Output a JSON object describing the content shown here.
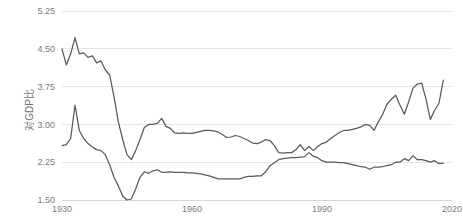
{
  "chart_data": {
    "type": "line",
    "title": "",
    "subtitle": "",
    "xlabel": "",
    "ylabel": "对GDP比",
    "xlim": [
      1930,
      2020
    ],
    "ylim": [
      1.5,
      5.25
    ],
    "grid": true,
    "legend_position": "none",
    "x_ticks": [
      "1930",
      "1960",
      "1990",
      "2020"
    ],
    "x_tick_values": [
      1930,
      1960,
      1990,
      2020
    ],
    "y_ticks": [
      "1.50",
      "2.25",
      "3.00",
      "3.75",
      "4.50",
      "5.25"
    ],
    "y_tick_values": [
      1.5,
      2.25,
      3.0,
      3.75,
      4.5,
      5.25
    ],
    "line_color": "#595959",
    "grid_color": "#dedede",
    "tick_label_color": "#7b7b7b",
    "background_color": "#ffffff",
    "x": [
      1930,
      1931,
      1932,
      1933,
      1934,
      1935,
      1936,
      1937,
      1938,
      1939,
      1940,
      1941,
      1942,
      1943,
      1944,
      1945,
      1946,
      1947,
      1948,
      1949,
      1950,
      1951,
      1952,
      1953,
      1954,
      1955,
      1956,
      1957,
      1958,
      1959,
      1960,
      1961,
      1962,
      1963,
      1964,
      1965,
      1966,
      1967,
      1968,
      1969,
      1970,
      1971,
      1972,
      1973,
      1974,
      1975,
      1976,
      1977,
      1978,
      1979,
      1980,
      1981,
      1982,
      1983,
      1984,
      1985,
      1986,
      1987,
      1988,
      1989,
      1990,
      1991,
      1992,
      1993,
      1994,
      1995,
      1996,
      1997,
      1998,
      1999,
      2000,
      2001,
      2002,
      2003,
      2004,
      2005,
      2006,
      2007,
      2008,
      2009,
      2010,
      2011,
      2012,
      2013,
      2014,
      2015,
      2016,
      2017,
      2018
    ],
    "series": [
      {
        "name": "series-upper",
        "values": [
          4.5,
          4.18,
          4.4,
          4.72,
          4.4,
          4.42,
          4.33,
          4.36,
          4.22,
          4.26,
          4.08,
          3.98,
          3.55,
          3.05,
          2.7,
          2.4,
          2.3,
          2.48,
          2.7,
          2.94,
          3.0,
          3.0,
          3.02,
          3.12,
          2.96,
          2.92,
          2.83,
          2.82,
          2.83,
          2.82,
          2.82,
          2.84,
          2.86,
          2.88,
          2.88,
          2.87,
          2.85,
          2.8,
          2.74,
          2.75,
          2.78,
          2.76,
          2.72,
          2.68,
          2.63,
          2.62,
          2.65,
          2.7,
          2.68,
          2.58,
          2.44,
          2.43,
          2.44,
          2.44,
          2.5,
          2.6,
          2.48,
          2.56,
          2.48,
          2.56,
          2.62,
          2.65,
          2.72,
          2.78,
          2.84,
          2.88,
          2.88,
          2.9,
          2.92,
          2.95,
          3.0,
          2.98,
          2.88,
          3.05,
          3.2,
          3.4,
          3.5,
          3.58,
          3.38,
          3.2,
          3.45,
          3.72,
          3.8,
          3.82,
          3.5,
          3.1,
          3.28,
          3.42,
          3.88
        ]
      },
      {
        "name": "series-lower",
        "values": [
          2.58,
          2.6,
          2.72,
          3.38,
          2.88,
          2.72,
          2.62,
          2.55,
          2.5,
          2.48,
          2.4,
          2.2,
          1.95,
          1.78,
          1.58,
          1.5,
          1.52,
          1.72,
          1.95,
          2.06,
          2.03,
          2.08,
          2.1,
          2.05,
          2.05,
          2.06,
          2.05,
          2.05,
          2.05,
          2.04,
          2.04,
          2.03,
          2.02,
          2.0,
          1.98,
          1.95,
          1.92,
          1.92,
          1.92,
          1.92,
          1.92,
          1.92,
          1.95,
          1.97,
          1.97,
          1.98,
          1.98,
          2.06,
          2.18,
          2.24,
          2.3,
          2.32,
          2.33,
          2.34,
          2.34,
          2.35,
          2.36,
          2.44,
          2.37,
          2.34,
          2.28,
          2.25,
          2.25,
          2.25,
          2.24,
          2.24,
          2.22,
          2.2,
          2.18,
          2.16,
          2.15,
          2.11,
          2.15,
          2.15,
          2.16,
          2.18,
          2.2,
          2.25,
          2.25,
          2.32,
          2.28,
          2.38,
          2.3,
          2.3,
          2.28,
          2.25,
          2.28,
          2.22,
          2.23
        ]
      }
    ]
  },
  "axis": {
    "y_title": "对GDP比"
  }
}
